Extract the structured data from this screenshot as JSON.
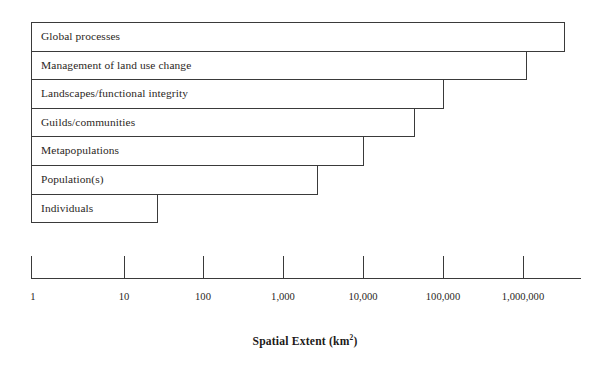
{
  "figure": {
    "title": "Spatial Extent (km",
    "title_sup": "2",
    "title_close": ")",
    "plot_bg": "#ffffff",
    "line_color": "#3a3a3a",
    "text_color": "#2b2724"
  },
  "chart_data": {
    "type": "bar",
    "orientation": "horizontal",
    "xlabel": "Spatial Extent (km²)",
    "ylabel": "",
    "xscale": "log",
    "xlim": [
      1,
      10000000
    ],
    "grid": false,
    "legend": null,
    "tick_labels": [
      "1",
      "10",
      "100",
      "1,000",
      "10,000",
      "100,000",
      "1,000,000"
    ],
    "tick_values": [
      1,
      10,
      100,
      1000,
      10000,
      100000,
      1000000
    ],
    "categories": [
      "Global processes",
      "Management of land use change",
      "Landscapes/functional integrity",
      "Guilds/communities",
      "Metapopulations",
      "Population(s)",
      "Individuals"
    ],
    "values": [
      4000000,
      1100000,
      110000,
      45000,
      10000,
      3000,
      30
    ],
    "bars": [
      {
        "label": "Global processes",
        "value": 4000000,
        "px_right": 565
      },
      {
        "label": "Management of land use change",
        "value": 1100000,
        "px_right": 527
      },
      {
        "label": "Landscapes/functional integrity",
        "value": 110000,
        "px_right": 444
      },
      {
        "label": "Guilds/communities",
        "value": 45000,
        "px_right": 415
      },
      {
        "label": "Metapopulations",
        "value": 10000,
        "px_right": 364
      },
      {
        "label": "Population(s)",
        "value": 3000,
        "px_right": 318
      },
      {
        "label": "Individuals",
        "value": 30,
        "px_right": 158
      }
    ]
  },
  "geometry": {
    "bar_left": 31,
    "bar_top": 22,
    "bar_height": 28.6,
    "axis_y": 278,
    "axis_left": 31,
    "axis_right": 581,
    "tick_top": 256,
    "tick_bottom": 279,
    "tick_px": [
      31,
      124,
      203,
      283,
      363,
      443,
      523
    ],
    "tick_label_y": 292,
    "axis_title_y": 335
  }
}
